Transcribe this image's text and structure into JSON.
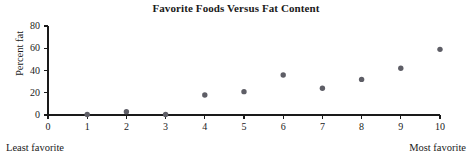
{
  "chart_data": {
    "type": "scatter",
    "title": "Favorite Foods Versus Fat Content",
    "xlabel": "",
    "ylabel": "Percent fat",
    "x": [
      1,
      2,
      3,
      4,
      5,
      6,
      7,
      8,
      9,
      10
    ],
    "values": [
      0.5,
      3,
      0.5,
      18,
      21,
      36,
      24,
      32,
      42,
      59
    ],
    "points": [
      {
        "x": 1,
        "y": 0.5
      },
      {
        "x": 2,
        "y": 3
      },
      {
        "x": 3,
        "y": 0.5
      },
      {
        "x": 4,
        "y": 18
      },
      {
        "x": 5,
        "y": 21
      },
      {
        "x": 6,
        "y": 36
      },
      {
        "x": 7,
        "y": 24
      },
      {
        "x": 8,
        "y": 32
      },
      {
        "x": 9,
        "y": 42
      },
      {
        "x": 10,
        "y": 59
      }
    ],
    "xlim": [
      0,
      10
    ],
    "ylim": [
      0,
      80
    ],
    "xticks": [
      0,
      1,
      2,
      3,
      4,
      5,
      6,
      7,
      8,
      9,
      10
    ],
    "yticks": [
      0,
      20,
      40,
      60,
      80
    ],
    "xtick_labels": [
      "0",
      "1",
      "2",
      "3",
      "4",
      "5",
      "6",
      "7",
      "8",
      "9",
      "10"
    ],
    "ytick_labels": [
      "0",
      "20",
      "40",
      "60",
      "80"
    ],
    "grid": false,
    "legend": null,
    "marker_color": "#5e5e66",
    "axis_color": "#1a1a1a",
    "background": "#ffffff",
    "annotations": [
      {
        "name": "least-favorite",
        "text": "Least favorite",
        "position": "bottom-left"
      },
      {
        "name": "most-favorite",
        "text": "Most favorite",
        "position": "bottom-right"
      }
    ]
  }
}
